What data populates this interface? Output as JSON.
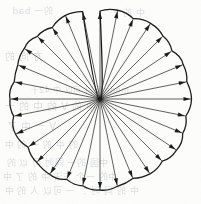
{
  "figure": {
    "kind": "line-drawing",
    "medium": "scanned page with reverse-side show-through",
    "background_color": "#fdfdfc",
    "ink_color": "#1a1a1a",
    "bleed_color": "#a9b0bb",
    "canvas": {
      "width": 201,
      "height": 204
    }
  },
  "chart_data": {
    "type": "scatter",
    "subtitle": "",
    "xlabel": "",
    "ylabel": "",
    "xlim": [
      0,
      201
    ],
    "ylim": [
      0,
      204
    ],
    "grid": false,
    "legend": "none",
    "center": {
      "x": 100,
      "y": 99
    },
    "arrow_count": 32,
    "angle_step_deg": 11.25,
    "mean_radius": 89,
    "radius_jitter": 3.5,
    "boundary": {
      "closed": true,
      "style": "irregular-hand-drawn",
      "bulge": 2.2,
      "stroke_width": 1.3
    },
    "arrows": {
      "stroke_width": 0.7,
      "head_length": 7,
      "head_width": 4.2,
      "direction": "outward-from-center"
    },
    "radii": [
      88.0,
      90.5,
      87.0,
      91.0,
      89.0,
      86.5,
      90.0,
      88.5,
      91.5,
      87.5,
      89.5,
      92.0,
      88.0,
      90.0,
      86.0,
      89.0,
      91.0,
      88.5,
      87.0,
      90.5,
      89.5,
      86.5,
      91.5,
      88.0,
      90.0,
      87.5,
      89.0,
      91.0,
      88.5,
      86.0,
      90.5,
      89.0
    ],
    "angles_deg": [
      0.0,
      11.25,
      22.5,
      33.75,
      45.0,
      56.25,
      67.5,
      78.75,
      90.0,
      101.25,
      112.5,
      123.75,
      135.0,
      146.25,
      157.5,
      168.75,
      180.0,
      191.25,
      202.5,
      213.75,
      225.0,
      236.25,
      247.5,
      258.75,
      270.0,
      281.25,
      292.5,
      303.75,
      315.0,
      326.25,
      337.5,
      348.75
    ]
  },
  "bleed_text": {
    "note": "faint mirrored show-through text from reverse of page",
    "lines": [
      {
        "text": "的一 bad",
        "x": 12,
        "y": 4,
        "size": 9
      },
      {
        "text": "中 的 了",
        "x": 110,
        "y": 6,
        "size": 9
      },
      {
        "text": "方 向 的",
        "x": 4,
        "y": 48,
        "size": 10
      },
      {
        "text": "mode 同时 可以 中 42十",
        "x": 30,
        "y": 84,
        "size": 8
      },
      {
        "text": "中 的 V 的 中 的 一",
        "x": 4,
        "y": 98,
        "size": 10
      },
      {
        "text": "V 一 中 了",
        "x": 6,
        "y": 118,
        "size": 10
      },
      {
        "text": "的 中 的 一 的 中",
        "x": 4,
        "y": 138,
        "size": 9
      },
      {
        "text": "中国 的一 同时 可 以 的",
        "x": 6,
        "y": 156,
        "size": 9
      },
      {
        "text": "中的 一个 方法 中 的 了 中",
        "x": 2,
        "y": 170,
        "size": 9
      },
      {
        "text": "中 的 同 时 ： 一 可以 人 的 中",
        "x": 4,
        "y": 184,
        "size": 9
      }
    ]
  }
}
